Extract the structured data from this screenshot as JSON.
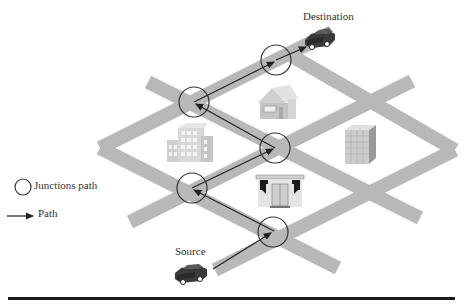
{
  "labels": {
    "destination": "Destination",
    "source": "Source"
  },
  "legend": {
    "junction": {
      "label": "Junctions path",
      "icon": "circle-icon"
    },
    "path": {
      "label": "Path",
      "icon": "arrow-right-icon"
    }
  },
  "colors": {
    "road": "#b3b3b3",
    "path_line": "#222222",
    "junction_stroke": "#333333",
    "building": "#c8c8c8",
    "car": "#444444"
  },
  "junctions": [
    {
      "id": "J1",
      "x": 194,
      "y": 102
    },
    {
      "id": "J2",
      "x": 276,
      "y": 60
    },
    {
      "id": "J3",
      "x": 275,
      "y": 148
    },
    {
      "id": "J4",
      "x": 192,
      "y": 188
    },
    {
      "id": "J5",
      "x": 273,
      "y": 232
    }
  ],
  "path_order": [
    "Source",
    "J5",
    "J4",
    "J3",
    "J1",
    "J2",
    "Destination"
  ],
  "buildings": [
    "house",
    "office-building",
    "tower-building",
    "shop"
  ]
}
